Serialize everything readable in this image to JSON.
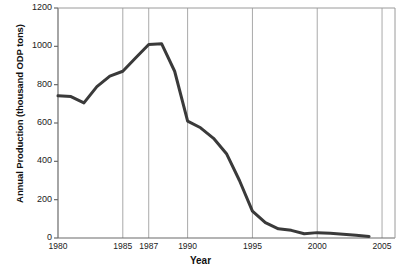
{
  "chart_data": {
    "type": "line",
    "title": "",
    "xlabel": "Year",
    "ylabel": "Annual Production (thousand ODP tons)",
    "xlim": [
      1980,
      2006
    ],
    "ylim": [
      0,
      1200
    ],
    "grid": "vertical-only",
    "legend": "none",
    "line_color": "#3a3a3a",
    "line_width": 3,
    "x_ticks": [
      1980,
      1985,
      1987,
      1990,
      1995,
      2000,
      2005
    ],
    "x_tick_labels": [
      "1980",
      "1985",
      "1987",
      "1990",
      "1995",
      "2000",
      "2005"
    ],
    "y_ticks": [
      0,
      200,
      400,
      600,
      800,
      1000,
      1200
    ],
    "y_tick_labels": [
      "0",
      "200",
      "400",
      "600",
      "800",
      "1000",
      "1200"
    ],
    "gridline_years": [
      1985,
      1987,
      1990,
      1995,
      2000,
      2005
    ],
    "x": [
      1980,
      1981,
      1982,
      1983,
      1984,
      1985,
      1986,
      1987,
      1988,
      1989,
      1990,
      1991,
      1992,
      1993,
      1994,
      1995,
      1996,
      1997,
      1998,
      1999,
      2000,
      2001,
      2002,
      2003,
      2004
    ],
    "values": [
      742,
      738,
      705,
      790,
      845,
      870,
      940,
      1010,
      1013,
      870,
      610,
      575,
      520,
      440,
      300,
      140,
      80,
      48,
      40,
      22,
      28,
      25,
      20,
      14,
      8
    ],
    "series": [
      {
        "name": "Annual Production",
        "values": [
          742,
          738,
          705,
          790,
          845,
          870,
          940,
          1010,
          1013,
          870,
          610,
          575,
          520,
          440,
          300,
          140,
          80,
          48,
          40,
          22,
          28,
          25,
          20,
          14,
          8
        ]
      }
    ]
  },
  "axes": {
    "y_title": "Annual Production (thousand ODP tons)",
    "x_title": "Year"
  }
}
